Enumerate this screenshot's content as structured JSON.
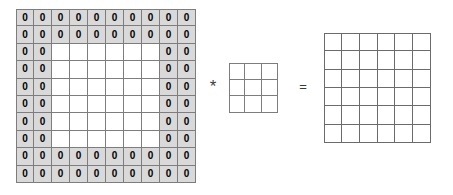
{
  "diagram": {
    "type": "convolution-operation",
    "operators": {
      "convolution": {
        "symbol": "*",
        "name": "asterisk-operator"
      },
      "equals": {
        "symbol": "=",
        "name": "equals-operator"
      }
    },
    "input_matrix": {
      "label": "padded-input-matrix",
      "rows": 10,
      "cols": 10,
      "padding_width": 2,
      "pad_value": "0",
      "inner_rows": 6,
      "inner_cols": 6,
      "pad_fill": "#d9d9d9",
      "inner_fill": "#ffffff",
      "line_color": "#7d7d7d",
      "values": [
        [
          "0",
          "0",
          "0",
          "0",
          "0",
          "0",
          "0",
          "0",
          "0",
          "0"
        ],
        [
          "0",
          "0",
          "0",
          "0",
          "0",
          "0",
          "0",
          "0",
          "0",
          "0"
        ],
        [
          "0",
          "0",
          "",
          "",
          "",
          "",
          "",
          "",
          "0",
          "0"
        ],
        [
          "0",
          "0",
          "",
          "",
          "",
          "",
          "",
          "",
          "0",
          "0"
        ],
        [
          "0",
          "0",
          "",
          "",
          "",
          "",
          "",
          "",
          "0",
          "0"
        ],
        [
          "0",
          "0",
          "",
          "",
          "",
          "",
          "",
          "",
          "0",
          "0"
        ],
        [
          "0",
          "0",
          "",
          "",
          "",
          "",
          "",
          "",
          "0",
          "0"
        ],
        [
          "0",
          "0",
          "",
          "",
          "",
          "",
          "",
          "",
          "0",
          "0"
        ],
        [
          "0",
          "0",
          "0",
          "0",
          "0",
          "0",
          "0",
          "0",
          "0",
          "0"
        ],
        [
          "0",
          "0",
          "0",
          "0",
          "0",
          "0",
          "0",
          "0",
          "0",
          "0"
        ]
      ]
    },
    "kernel_matrix": {
      "label": "kernel-matrix",
      "rows": 3,
      "cols": 3,
      "line_color": "#7d7d7d",
      "values": [
        [
          "",
          "",
          ""
        ],
        [
          "",
          "",
          ""
        ],
        [
          "",
          "",
          ""
        ]
      ]
    },
    "output_matrix": {
      "label": "output-matrix",
      "rows": 6,
      "cols": 6,
      "line_color": "#6b6b6b",
      "values": [
        [
          "",
          "",
          "",
          "",
          "",
          ""
        ],
        [
          "",
          "",
          "",
          "",
          "",
          ""
        ],
        [
          "",
          "",
          "",
          "",
          "",
          ""
        ],
        [
          "",
          "",
          "",
          "",
          "",
          ""
        ],
        [
          "",
          "",
          "",
          "",
          "",
          ""
        ],
        [
          "",
          "",
          "",
          "",
          "",
          ""
        ]
      ]
    }
  }
}
